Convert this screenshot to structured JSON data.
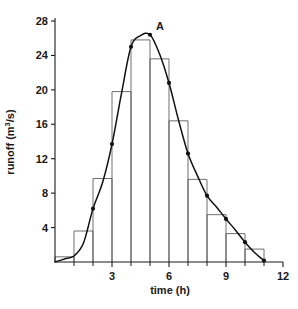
{
  "chart_data": {
    "type": "bar",
    "title": "",
    "subtitle": "",
    "xlabel": "time (h)",
    "ylabel": "runoff (m3/s)",
    "ylabel_parts": {
      "base": "runoff (m",
      "sup": "3",
      "tail": "/s)"
    },
    "xlim": [
      0,
      12
    ],
    "ylim": [
      0,
      28
    ],
    "grid": false,
    "legend": null,
    "x_ticks": [
      3,
      6,
      9,
      12
    ],
    "x_tick_labels": [
      "3",
      "6",
      "9",
      "12"
    ],
    "x_minor_ticks": [
      1,
      2,
      4,
      5,
      7,
      8,
      10,
      11
    ],
    "y_ticks": [
      4,
      8,
      12,
      16,
      20,
      24,
      28
    ],
    "y_tick_labels": [
      "4",
      "8",
      "12",
      "16",
      "20",
      "24",
      "28"
    ],
    "categories": [
      "0-1",
      "1-2",
      "2-3",
      "3-4",
      "4-5",
      "5-6",
      "6-7",
      "7-8",
      "8-9",
      "9-10",
      "10-11",
      "11-12"
    ],
    "bar_intervals": [
      [
        0,
        1
      ],
      [
        1,
        2
      ],
      [
        2,
        3
      ],
      [
        3,
        4
      ],
      [
        4,
        5
      ],
      [
        5,
        6
      ],
      [
        6,
        7
      ],
      [
        7,
        8
      ],
      [
        8,
        9
      ],
      [
        9,
        10
      ],
      [
        10,
        11
      ],
      [
        11,
        12
      ]
    ],
    "values": [
      0.6,
      3.6,
      9.7,
      19.8,
      25.8,
      23.6,
      16.4,
      9.6,
      5.5,
      3.3,
      1.5,
      0.0
    ],
    "series": [
      {
        "name": "runoff hydrograph (smoothed)",
        "type": "line",
        "x": [
          0.0,
          0.5,
          1.0,
          1.5,
          2.0,
          2.5,
          3.0,
          3.5,
          4.0,
          4.5,
          5.0,
          5.5,
          6.0,
          6.5,
          7.0,
          7.5,
          8.0,
          8.5,
          9.0,
          9.5,
          10.0,
          10.5,
          11.0
        ],
        "y": [
          0.0,
          0.35,
          0.7,
          2.2,
          6.2,
          9.2,
          13.7,
          19.6,
          25.0,
          26.3,
          26.4,
          24.2,
          20.8,
          16.5,
          12.6,
          10.0,
          7.7,
          6.4,
          5.0,
          3.7,
          2.3,
          1.1,
          0.15
        ],
        "markers_x": [
          2.0,
          3.0,
          4.0,
          5.0,
          6.0,
          7.0,
          8.0,
          9.0,
          10.0,
          11.0
        ],
        "markers_y": [
          6.2,
          13.7,
          25.0,
          26.4,
          20.8,
          12.6,
          7.7,
          5.0,
          2.3,
          0.15
        ]
      }
    ],
    "annotations": [
      {
        "label": "A",
        "x": 5.0,
        "y": 26.4,
        "note": "peak of hydrograph"
      }
    ],
    "colors": {
      "curve": "#111111",
      "bars": "#555555",
      "axis": "#1a1a1a",
      "background": "#ffffff"
    }
  }
}
